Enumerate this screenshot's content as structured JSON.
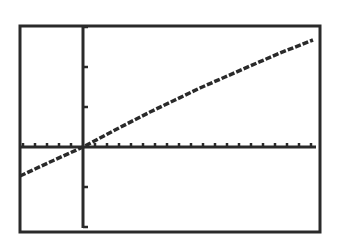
{
  "chart_data": {
    "type": "line",
    "title": "",
    "xlabel": "",
    "ylabel": "",
    "grid": false,
    "legend": null,
    "axes": {
      "x_tick_count_visible": 20,
      "y_tick_count_visible": 5,
      "x_tick_spacing_px": 12,
      "y_tick_spacing_px": 40
    },
    "window_px": {
      "left": 20,
      "top": 26,
      "right": 320,
      "bottom": 232
    },
    "origin_px": {
      "x": 83,
      "y": 147
    },
    "series": [
      {
        "name": "Y1",
        "points_px": [
          [
            20,
            176
          ],
          [
            50,
            162
          ],
          [
            83,
            147
          ],
          [
            115,
            130
          ],
          [
            150,
            112
          ],
          [
            175,
            100
          ],
          [
            200,
            88
          ],
          [
            225,
            77
          ],
          [
            250,
            66
          ],
          [
            280,
            53
          ],
          [
            313,
            40
          ]
        ]
      }
    ]
  },
  "colors": {
    "background": "#ffffff",
    "ink": "#2a2a2a"
  }
}
